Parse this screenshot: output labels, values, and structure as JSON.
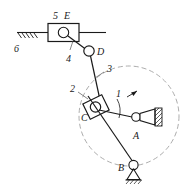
{
  "figure": {
    "type": "kinematic-mechanism-diagram",
    "title": "",
    "background_color": "#ffffff",
    "line_color": "#1a1a1a",
    "dashed_color": "#8a8a8a"
  },
  "labels": {
    "link5": "5",
    "pointE": "E",
    "ground6": "6",
    "link4": "4",
    "pointD": "D",
    "link3": "3",
    "link2": "2",
    "pointC": "C",
    "link1": "1",
    "pointA": "A",
    "pointB": "B"
  },
  "geometry": {
    "rail_y": 33,
    "rail_x_start": 17,
    "rail_x_end": 106,
    "slider_e": {
      "x": 48,
      "y": 24,
      "w": 31,
      "h": 18,
      "pin_cx": 64,
      "pin_cy": 33,
      "pin_r": 5
    },
    "joint_d": {
      "cx": 89,
      "cy": 51,
      "r": 5
    },
    "slider_c": {
      "cx": 94,
      "cy": 107,
      "w": 19,
      "h": 16,
      "angle": -28,
      "pin_r": 5
    },
    "pivot_a": {
      "cx": 136,
      "cy": 117,
      "r": 4
    },
    "pivot_b": {
      "cx": 133,
      "cy": 166,
      "r": 4.5
    },
    "crank_circle": {
      "cx": 129,
      "cy": 116,
      "r": 50
    }
  },
  "elements": [
    {
      "name": "ground-hatch-left",
      "label": "6"
    },
    {
      "name": "horizontal-rail",
      "label": ""
    },
    {
      "name": "slider-block-e",
      "label": "5"
    },
    {
      "name": "link-4",
      "label": "4"
    },
    {
      "name": "joint-d",
      "label": "D"
    },
    {
      "name": "link-3",
      "label": "3"
    },
    {
      "name": "slider-block-2",
      "label": "2"
    },
    {
      "name": "joint-c",
      "label": "C"
    },
    {
      "name": "crank-1",
      "label": "1"
    },
    {
      "name": "fixed-pivot-a",
      "label": "A"
    },
    {
      "name": "fixed-pivot-b",
      "label": "B"
    },
    {
      "name": "crank-path-circle",
      "label": ""
    }
  ]
}
